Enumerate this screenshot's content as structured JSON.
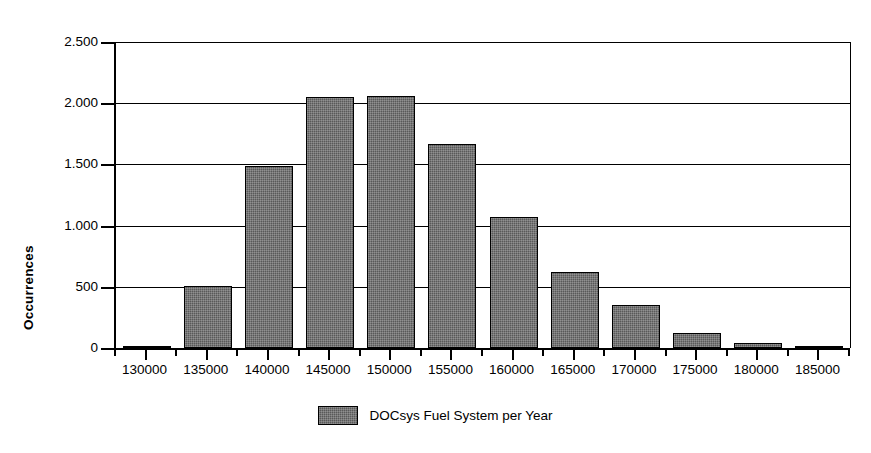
{
  "chart_data": {
    "type": "bar",
    "title": "",
    "subtitle": "",
    "xlabel": "",
    "ylabel": "Occurrences",
    "categories": [
      "130000",
      "135000",
      "140000",
      "145000",
      "150000",
      "155000",
      "160000",
      "165000",
      "170000",
      "175000",
      "180000",
      "185000"
    ],
    "values": [
      10,
      510,
      1490,
      2050,
      2055,
      1670,
      1070,
      620,
      348,
      125,
      45,
      10
    ],
    "series": [
      {
        "name": "DOCsys Fuel System per Year",
        "values": [
          10,
          510,
          1490,
          2050,
          2055,
          1670,
          1070,
          620,
          348,
          125,
          45,
          10
        ]
      }
    ],
    "xtick_labels": [
      "130000",
      "135000",
      "140000",
      "145000",
      "150000",
      "155000",
      "160000",
      "165000",
      "170000",
      "175000",
      "180000",
      "185000"
    ],
    "ytick_labels": [
      "0",
      "500",
      "1.000",
      "1.500",
      "2.000",
      "2.500"
    ],
    "ytick_values": [
      0,
      500,
      1000,
      1500,
      2000,
      2500
    ],
    "ylim": [
      0,
      2500
    ],
    "xlim": [
      127500,
      187500
    ],
    "grid": "horizontal",
    "legend_position": "bottom-center",
    "bar_color": "#595959",
    "bar_edge_color": "#000000",
    "axis_color": "#000000",
    "background_color": "#ffffff"
  },
  "legend": {
    "entries": [
      {
        "label": "DOCsys Fuel System per Year",
        "swatch_name": "legend-swatch-docsys"
      }
    ]
  }
}
